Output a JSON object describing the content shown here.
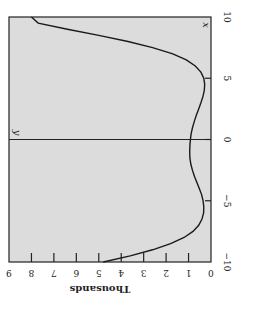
{
  "chart_data": {
    "type": "line",
    "orientation": "rotated-90-clockwise",
    "title": "",
    "xlabel": "x",
    "ylabel": "Thousands",
    "y_axis_marker_label": "y",
    "xlim": [
      -10,
      10
    ],
    "ylim": [
      0,
      9
    ],
    "x_ticks": [
      -10,
      -5,
      0,
      5,
      10
    ],
    "x_tick_labels": [
      "−10",
      "−5",
      "0",
      "5",
      "10"
    ],
    "y_ticks": [
      0,
      1,
      2,
      3,
      4,
      5,
      6,
      7,
      8,
      9
    ],
    "y_tick_labels": [
      "0",
      "1",
      "2",
      "3",
      "4",
      "5",
      "6",
      "7",
      "8",
      "9"
    ],
    "grid": false,
    "background": "#dcdcdc",
    "line_color": "#1a1a1a",
    "series": [
      {
        "name": "y",
        "x": [
          -10,
          -9.5,
          -9,
          -8.5,
          -8,
          -7.5,
          -7,
          -6.5,
          -6,
          -5.5,
          -5,
          -4.5,
          -4,
          -3.5,
          -3,
          -2.5,
          -2,
          -1.5,
          -1,
          -0.5,
          0,
          0.5,
          1,
          1.5,
          2,
          2.5,
          3,
          3.5,
          4,
          4.5,
          5,
          5.5,
          6,
          6.5,
          7,
          7.5,
          8,
          8.5,
          9,
          9.5,
          10
        ],
        "values": [
          4.8,
          3.6,
          2.6,
          1.8,
          1.2,
          0.8,
          0.55,
          0.4,
          0.33,
          0.32,
          0.35,
          0.42,
          0.52,
          0.63,
          0.74,
          0.83,
          0.9,
          0.94,
          0.95,
          0.94,
          0.92,
          0.88,
          0.82,
          0.74,
          0.65,
          0.55,
          0.45,
          0.36,
          0.3,
          0.28,
          0.32,
          0.45,
          0.7,
          1.1,
          1.7,
          2.6,
          3.7,
          5.0,
          6.4,
          7.7,
          8.0
        ]
      }
    ]
  }
}
